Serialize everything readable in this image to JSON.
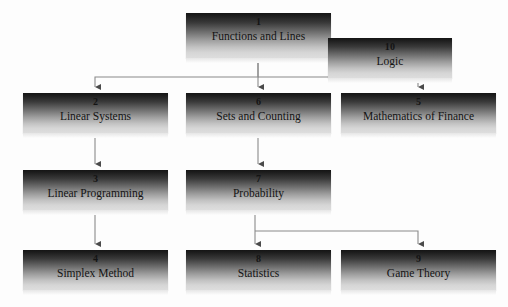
{
  "diagram": {
    "background_color": "#fdfdfd",
    "box_gradient_top": "#151515",
    "box_gradient_bottom": "#dddddd",
    "connector_color": "#8a8a8a",
    "nodes": [
      {
        "id": "n1",
        "number": "1",
        "label": "Functions and Lines",
        "x": 186,
        "y": 13,
        "w": 145,
        "h": 45
      },
      {
        "id": "n10",
        "number": "10",
        "label": "Logic",
        "x": 328,
        "y": 38,
        "w": 124,
        "h": 40
      },
      {
        "id": "n2",
        "number": "2",
        "label": "Linear Systems",
        "x": 23,
        "y": 93,
        "w": 145,
        "h": 40
      },
      {
        "id": "n6",
        "number": "6",
        "label": "Sets and Counting",
        "x": 186,
        "y": 93,
        "w": 145,
        "h": 40
      },
      {
        "id": "n5",
        "number": "5",
        "label": "Mathematics of Finance",
        "x": 341,
        "y": 93,
        "w": 155,
        "h": 40
      },
      {
        "id": "n3",
        "number": "3",
        "label": "Linear Programming",
        "x": 23,
        "y": 170,
        "w": 145,
        "h": 40
      },
      {
        "id": "n7",
        "number": "7",
        "label": "Probability",
        "x": 186,
        "y": 170,
        "w": 145,
        "h": 40
      },
      {
        "id": "n4",
        "number": "4",
        "label": "Simplex Method",
        "x": 23,
        "y": 250,
        "w": 145,
        "h": 40
      },
      {
        "id": "n8",
        "number": "8",
        "label": "Statistics",
        "x": 186,
        "y": 250,
        "w": 145,
        "h": 40
      },
      {
        "id": "n9",
        "number": "9",
        "label": "Game Theory",
        "x": 341,
        "y": 250,
        "w": 155,
        "h": 40
      }
    ],
    "edges": [
      {
        "from": "1",
        "to": "2",
        "kind": "elbow-left"
      },
      {
        "from": "1",
        "to": "6",
        "kind": "straight"
      },
      {
        "from": "1",
        "to": "5",
        "kind": "elbow-right"
      },
      {
        "from": "2",
        "to": "3",
        "kind": "straight"
      },
      {
        "from": "3",
        "to": "4",
        "kind": "straight"
      },
      {
        "from": "6",
        "to": "7",
        "kind": "straight"
      },
      {
        "from": "7",
        "to": "8",
        "kind": "straight"
      },
      {
        "from": "7",
        "to": "9",
        "kind": "elbow-right"
      }
    ]
  }
}
